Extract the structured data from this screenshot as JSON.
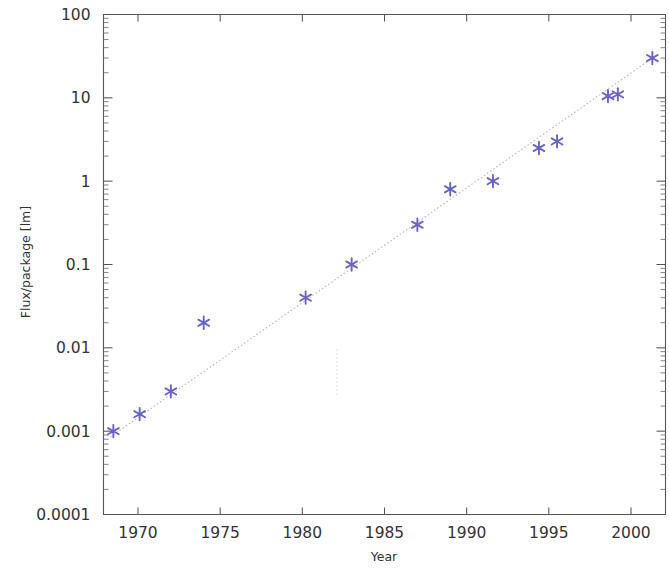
{
  "chart_data": {
    "type": "scatter",
    "title": "",
    "subtitle": "",
    "xlabel": "Year",
    "ylabel": "Flux/package [lm]",
    "xlim": [
      1967.9,
      2002.1
    ],
    "ylim": [
      0.0001,
      100
    ],
    "yscale": "log",
    "xscale": "linear",
    "grid": false,
    "legend": "none",
    "xticks": [
      1970,
      1975,
      1980,
      1985,
      1990,
      1995,
      2000
    ],
    "xtick_labels": [
      "1970",
      "1975",
      "1980",
      "1985",
      "1990",
      "1995",
      "2000"
    ],
    "yticks": [
      0.0001,
      0.001,
      0.01,
      0.1,
      1,
      10,
      100
    ],
    "ytick_labels": [
      "0.0001",
      "0.001",
      "0.01",
      "0.1",
      "1",
      "10",
      "100"
    ],
    "marker_style": "asterisk",
    "marker_color": "#6a64c4",
    "fit_line_color": "#b9b9cf",
    "fit_line_style": "dotted",
    "series": [
      {
        "name": "Flux per package",
        "points": [
          {
            "x": 1968.5,
            "y": 0.001
          },
          {
            "x": 1970.1,
            "y": 0.0016
          },
          {
            "x": 1972.0,
            "y": 0.003
          },
          {
            "x": 1974.0,
            "y": 0.02
          },
          {
            "x": 1980.2,
            "y": 0.04
          },
          {
            "x": 1983.0,
            "y": 0.1
          },
          {
            "x": 1987.0,
            "y": 0.3
          },
          {
            "x": 1989.0,
            "y": 0.8
          },
          {
            "x": 1991.6,
            "y": 1.0
          },
          {
            "x": 1994.4,
            "y": 2.5
          },
          {
            "x": 1995.5,
            "y": 3.0
          },
          {
            "x": 1998.6,
            "y": 10.5
          },
          {
            "x": 1999.2,
            "y": 11.0
          },
          {
            "x": 2001.3,
            "y": 30.0
          }
        ]
      },
      {
        "name": "Trend line",
        "type": "line",
        "points": [
          {
            "x": 1968.3,
            "y": 0.00085
          },
          {
            "x": 2001.6,
            "y": 33.0
          }
        ]
      }
    ],
    "artifacts": [
      {
        "name": "faint-dotted-speckle",
        "x": 1982.1,
        "y_top": 0.0095,
        "y_bottom": 0.0026
      }
    ]
  },
  "axes": {
    "x_axis_title": "Year",
    "y_axis_title": "Flux/package [lm]"
  }
}
